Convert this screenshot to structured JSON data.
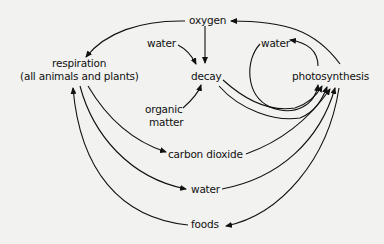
{
  "diagram": {
    "type": "cycle-diagram",
    "nodes": {
      "oxygen": "oxygen",
      "water_input_decay": "water",
      "respiration_title": "respiration",
      "respiration_subtitle": "(all animals and plants)",
      "decay": "decay",
      "organic_matter_line1": "organic",
      "organic_matter_line2": "matter",
      "water_cycle": "water",
      "photosynthesis": "photosynthesis",
      "carbon_dioxide": "carbon dioxide",
      "water_bottom": "water",
      "foods": "foods"
    },
    "edges": [
      {
        "from": "oxygen",
        "to": "respiration"
      },
      {
        "from": "oxygen",
        "to": "decay"
      },
      {
        "from": "water",
        "to": "decay"
      },
      {
        "from": "organic matter",
        "to": "decay"
      },
      {
        "from": "photosynthesis",
        "to": "oxygen"
      },
      {
        "from": "photosynthesis",
        "to": "water"
      },
      {
        "from": "water",
        "to": "photosynthesis"
      },
      {
        "from": "decay",
        "to": "photosynthesis"
      },
      {
        "from": "decay",
        "to": "photosynthesis"
      },
      {
        "from": "respiration",
        "to": "carbon dioxide"
      },
      {
        "from": "respiration",
        "to": "water"
      },
      {
        "from": "carbon dioxide",
        "to": "photosynthesis"
      },
      {
        "from": "water",
        "to": "photosynthesis"
      },
      {
        "from": "foods",
        "to": "respiration"
      },
      {
        "from": "photosynthesis",
        "to": "foods"
      }
    ]
  }
}
